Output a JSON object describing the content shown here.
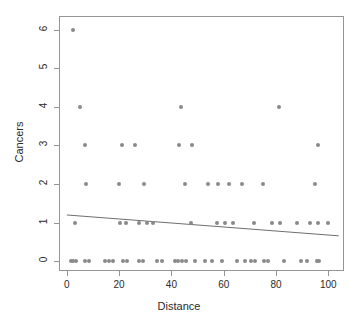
{
  "chart_data": {
    "type": "scatter",
    "title": "",
    "xlabel": "Distance",
    "ylabel": "Cancers",
    "xlim": [
      -3,
      106
    ],
    "ylim": [
      -0.25,
      6.35
    ],
    "xticks": [
      0,
      20,
      40,
      60,
      80,
      100
    ],
    "yticks": [
      0,
      1,
      2,
      3,
      4,
      5,
      6
    ],
    "grid": false,
    "legend": null,
    "point_color": "#8a8a8a",
    "line_color": "#6e6e6e",
    "frame_color": "#959595",
    "series": [
      {
        "name": "observations",
        "x": [
          2.5,
          5.0,
          43.5,
          81.0,
          7.0,
          21.0,
          26.0,
          43.0,
          48.0,
          96.0,
          7.5,
          20.0,
          29.5,
          45.0,
          54.0,
          58.0,
          62.0,
          67.0,
          75.0,
          95.0,
          3.0,
          20.5,
          22.5,
          27.5,
          30.5,
          33.0,
          47.5,
          57.5,
          60.5,
          63.5,
          71.5,
          78.5,
          81.5,
          88.0,
          93.0,
          96.0,
          100.0,
          1.5,
          2.5,
          3.5,
          7.0,
          8.5,
          14.5,
          16.0,
          17.5,
          21.5,
          23.0,
          27.5,
          29.0,
          34.5,
          36.5,
          41.5,
          42.5,
          44.0,
          45.5,
          49.0,
          53.0,
          55.5,
          59.5,
          65.0,
          68.0,
          70.5,
          72.0,
          75.5,
          77.0,
          83.0,
          89.5,
          92.0,
          95.5,
          96.5
        ],
        "y": [
          6,
          4,
          4,
          4,
          3,
          3,
          3,
          3,
          3,
          3,
          2,
          2,
          2,
          2,
          2,
          2,
          2,
          2,
          2,
          2,
          1,
          1,
          1,
          1,
          1,
          1,
          1,
          1,
          1,
          1,
          1,
          1,
          1,
          1,
          1,
          1,
          1,
          0,
          0,
          0,
          0,
          0,
          0,
          0,
          0,
          0,
          0,
          0,
          0,
          0,
          0,
          0,
          0,
          0,
          0,
          0,
          0,
          0,
          0,
          0,
          0,
          0,
          0,
          0,
          0,
          0,
          0,
          0,
          0,
          0
        ]
      }
    ],
    "fit_line": {
      "name": "linear-fit",
      "x_start": 0,
      "y_start": 1.2,
      "x_end": 104,
      "y_end": 0.66
    }
  },
  "axes": {
    "x_tick_labels": [
      "0",
      "20",
      "40",
      "60",
      "80",
      "100"
    ],
    "y_tick_labels": [
      "0",
      "1",
      "2",
      "3",
      "4",
      "5",
      "6"
    ],
    "x_axis_title": "Distance",
    "y_axis_title": "Cancers"
  }
}
